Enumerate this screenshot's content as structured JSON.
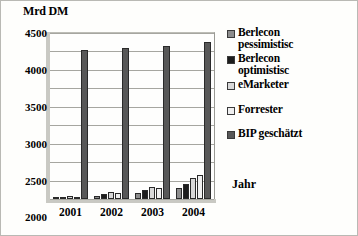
{
  "chart_data": {
    "type": "bar",
    "title": "",
    "ylabel": "Mrd DM",
    "xlabel": "Jahr",
    "categories": [
      "2001",
      "2002",
      "2003",
      "2004"
    ],
    "ylim": [
      0,
      4500
    ],
    "ytick_labels": [
      "4500",
      "4000",
      "3500",
      "3000",
      "2500",
      "2000",
      "1500",
      "1000",
      "500",
      "0"
    ],
    "ytick_values": [
      4500,
      4000,
      3500,
      3000,
      2500,
      2000,
      1500,
      1000,
      500,
      0
    ],
    "grid": true,
    "legend_position": "right",
    "series": [
      {
        "name": "Berlecon pessimistisc",
        "color": "#8d8d8d",
        "values": [
          40,
          90,
          170,
          290
        ]
      },
      {
        "name": "Berlecon optimistisc",
        "color": "#1d1d1d",
        "values": [
          55,
          130,
          250,
          420
        ]
      },
      {
        "name": "eMarketer",
        "color": "#d8d8d8",
        "values": [
          75,
          180,
          330,
          560
        ]
      },
      {
        "name": "Forrester",
        "color": "#efefef",
        "values": [
          60,
          150,
          300,
          640
        ]
      },
      {
        "name": "BIP geschätzt",
        "color": "#585858",
        "values": [
          4050,
          4100,
          4150,
          4250
        ]
      }
    ]
  },
  "legend": {
    "items": [
      {
        "label_line1": "Berlecon",
        "label_line2": "pessimistisc"
      },
      {
        "label_line1": "Berlecon",
        "label_line2": "optimistisc"
      },
      {
        "label_line1": "eMarketer",
        "label_line2": ""
      },
      {
        "label_line1": "Forrester",
        "label_line2": ""
      },
      {
        "label_line1": "BIP geschätzt",
        "label_line2": ""
      }
    ]
  }
}
